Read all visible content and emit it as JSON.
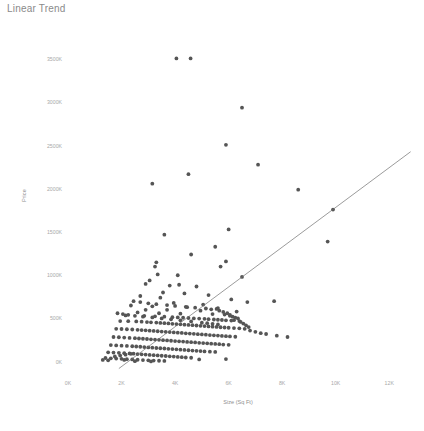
{
  "chart_data": {
    "type": "scatter",
    "title": "Linear Trend",
    "xlabel": "Size (Sq Ft)",
    "ylabel": "Price",
    "xlim": [
      0,
      13000
    ],
    "ylim": [
      -120000,
      3700000
    ],
    "grid": false,
    "legend": null,
    "xtick_labels": [
      "0K",
      "2K",
      "4K",
      "6K",
      "8K",
      "10K",
      "12K"
    ],
    "xtick_values": [
      0,
      2000,
      4000,
      6000,
      8000,
      10000,
      12000
    ],
    "ytick_labels": [
      "0K",
      "500K",
      "1000K",
      "1500K",
      "2000K",
      "2500K",
      "3000K",
      "3500K"
    ],
    "ytick_values": [
      0,
      500000,
      1000000,
      1500000,
      2000000,
      2500000,
      3000000,
      3500000
    ],
    "marker_color": "#555555",
    "marker_size": 1.9,
    "trendline": {
      "name": "Linear Trend",
      "color": "#707070",
      "width": 0.7,
      "x": [
        1900,
        12800
      ],
      "y": [
        -80000,
        2430000
      ]
    },
    "series": [
      {
        "name": "Houses",
        "points": [
          [
            4050,
            3510000
          ],
          [
            4580,
            3510000
          ],
          [
            6500,
            2940000
          ],
          [
            5900,
            2510000
          ],
          [
            7100,
            2280000
          ],
          [
            4500,
            2170000
          ],
          [
            3150,
            2060000
          ],
          [
            8600,
            1990000
          ],
          [
            9900,
            1760000
          ],
          [
            6000,
            1530000
          ],
          [
            3600,
            1470000
          ],
          [
            9700,
            1390000
          ],
          [
            5500,
            1330000
          ],
          [
            4600,
            1240000
          ],
          [
            5900,
            1160000
          ],
          [
            3300,
            1150000
          ],
          [
            3250,
            1100000
          ],
          [
            5700,
            1100000
          ],
          [
            3350,
            1010000
          ],
          [
            4100,
            1000000
          ],
          [
            6500,
            980000
          ],
          [
            3050,
            940000
          ],
          [
            2900,
            900000
          ],
          [
            4150,
            890000
          ],
          [
            3800,
            880000
          ],
          [
            4800,
            870000
          ],
          [
            3550,
            800000
          ],
          [
            4350,
            790000
          ],
          [
            5250,
            770000
          ],
          [
            2700,
            760000
          ],
          [
            3450,
            740000
          ],
          [
            6100,
            720000
          ],
          [
            7700,
            700000
          ],
          [
            6700,
            690000
          ],
          [
            3950,
            680000
          ],
          [
            5050,
            660000
          ],
          [
            2350,
            650000
          ],
          [
            3150,
            640000
          ],
          [
            4450,
            630000
          ],
          [
            5600,
            620000
          ],
          [
            2900,
            600000
          ],
          [
            3700,
            600000
          ],
          [
            4950,
            590000
          ],
          [
            6300,
            580000
          ],
          [
            2600,
            570000
          ],
          [
            3400,
            560000
          ],
          [
            4200,
            555000
          ],
          [
            5400,
            550000
          ],
          [
            5850,
            545000
          ],
          [
            6050,
            540000
          ],
          [
            2150,
            535000
          ],
          [
            2850,
            530000
          ],
          [
            3250,
            525000
          ],
          [
            3600,
            520000
          ],
          [
            3900,
            515000
          ],
          [
            4100,
            512000
          ],
          [
            4300,
            508000
          ],
          [
            4500,
            505000
          ],
          [
            4700,
            500000
          ],
          [
            4900,
            498000
          ],
          [
            5100,
            495000
          ],
          [
            5250,
            492000
          ],
          [
            5450,
            488000
          ],
          [
            5600,
            485000
          ],
          [
            5750,
            482000
          ],
          [
            5900,
            478000
          ],
          [
            6100,
            475000
          ],
          [
            1950,
            470000
          ],
          [
            2250,
            468000
          ],
          [
            2550,
            465000
          ],
          [
            2750,
            462000
          ],
          [
            2950,
            458000
          ],
          [
            3100,
            455000
          ],
          [
            3300,
            452000
          ],
          [
            3450,
            448000
          ],
          [
            3600,
            445000
          ],
          [
            3750,
            442000
          ],
          [
            3900,
            438000
          ],
          [
            4050,
            435000
          ],
          [
            4200,
            432000
          ],
          [
            4350,
            428000
          ],
          [
            4500,
            425000
          ],
          [
            4650,
            422000
          ],
          [
            4800,
            418000
          ],
          [
            4950,
            415000
          ],
          [
            5100,
            412000
          ],
          [
            5250,
            408000
          ],
          [
            5400,
            405000
          ],
          [
            5550,
            402000
          ],
          [
            5700,
            398000
          ],
          [
            5850,
            395000
          ],
          [
            6000,
            392000
          ],
          [
            6200,
            388000
          ],
          [
            6400,
            385000
          ],
          [
            1800,
            380000
          ],
          [
            2000,
            378000
          ],
          [
            2200,
            375000
          ],
          [
            2400,
            372000
          ],
          [
            2600,
            368000
          ],
          [
            2750,
            365000
          ],
          [
            2900,
            362000
          ],
          [
            3050,
            358000
          ],
          [
            3200,
            355000
          ],
          [
            3350,
            352000
          ],
          [
            3500,
            348000
          ],
          [
            3650,
            345000
          ],
          [
            3800,
            342000
          ],
          [
            3950,
            338000
          ],
          [
            4100,
            335000
          ],
          [
            4250,
            332000
          ],
          [
            4400,
            328000
          ],
          [
            4550,
            325000
          ],
          [
            4700,
            322000
          ],
          [
            4850,
            318000
          ],
          [
            5000,
            315000
          ],
          [
            5150,
            312000
          ],
          [
            5300,
            308000
          ],
          [
            5450,
            305000
          ],
          [
            5600,
            302000
          ],
          [
            5750,
            298000
          ],
          [
            5900,
            295000
          ],
          [
            6050,
            292000
          ],
          [
            6250,
            288000
          ],
          [
            1700,
            285000
          ],
          [
            1900,
            282000
          ],
          [
            2100,
            278000
          ],
          [
            2300,
            275000
          ],
          [
            2500,
            272000
          ],
          [
            2650,
            268000
          ],
          [
            2800,
            265000
          ],
          [
            2950,
            262000
          ],
          [
            3100,
            258000
          ],
          [
            3250,
            255000
          ],
          [
            3400,
            252000
          ],
          [
            3550,
            248000
          ],
          [
            3700,
            245000
          ],
          [
            3850,
            242000
          ],
          [
            4000,
            238000
          ],
          [
            4150,
            235000
          ],
          [
            4300,
            232000
          ],
          [
            4450,
            228000
          ],
          [
            4600,
            225000
          ],
          [
            4750,
            222000
          ],
          [
            4900,
            218000
          ],
          [
            5050,
            215000
          ],
          [
            5200,
            212000
          ],
          [
            5350,
            208000
          ],
          [
            5500,
            205000
          ],
          [
            5650,
            202000
          ],
          [
            5800,
            198000
          ],
          [
            6000,
            195000
          ],
          [
            1600,
            192000
          ],
          [
            1800,
            188000
          ],
          [
            2000,
            185000
          ],
          [
            2200,
            182000
          ],
          [
            2400,
            178000
          ],
          [
            2550,
            175000
          ],
          [
            2700,
            172000
          ],
          [
            2850,
            168000
          ],
          [
            3000,
            165000
          ],
          [
            3150,
            162000
          ],
          [
            3300,
            158000
          ],
          [
            3450,
            155000
          ],
          [
            3600,
            152000
          ],
          [
            3750,
            148000
          ],
          [
            3900,
            145000
          ],
          [
            4050,
            142000
          ],
          [
            4200,
            138000
          ],
          [
            4350,
            135000
          ],
          [
            4500,
            132000
          ],
          [
            4650,
            128000
          ],
          [
            4800,
            125000
          ],
          [
            4950,
            122000
          ],
          [
            5100,
            118000
          ],
          [
            5300,
            115000
          ],
          [
            5500,
            112000
          ],
          [
            1500,
            108000
          ],
          [
            1700,
            105000
          ],
          [
            1900,
            102000
          ],
          [
            2100,
            98000
          ],
          [
            2300,
            95000
          ],
          [
            2450,
            92000
          ],
          [
            2600,
            88000
          ],
          [
            2750,
            85000
          ],
          [
            2900,
            82000
          ],
          [
            3050,
            78000
          ],
          [
            3200,
            75000
          ],
          [
            3350,
            72000
          ],
          [
            3500,
            68000
          ],
          [
            3650,
            65000
          ],
          [
            3800,
            62000
          ],
          [
            3950,
            58000
          ],
          [
            4100,
            55000
          ],
          [
            4250,
            52000
          ],
          [
            4400,
            48000
          ],
          [
            4600,
            45000
          ],
          [
            1400,
            42000
          ],
          [
            1600,
            38000
          ],
          [
            1800,
            35000
          ],
          [
            2000,
            32000
          ],
          [
            2200,
            28000
          ],
          [
            2400,
            25000
          ],
          [
            2600,
            22000
          ],
          [
            2800,
            18000
          ],
          [
            3000,
            15000
          ],
          [
            3200,
            12000
          ],
          [
            3400,
            10000
          ],
          [
            3600,
            8000
          ],
          [
            1300,
            20000
          ],
          [
            1500,
            15000
          ],
          [
            5900,
            30000
          ],
          [
            4900,
            25000
          ],
          [
            2500,
            5000
          ],
          [
            3100,
            2000
          ],
          [
            6200,
            480000
          ],
          [
            6400,
            470000
          ],
          [
            6550,
            440000
          ],
          [
            6650,
            420000
          ],
          [
            6750,
            400000
          ],
          [
            6250,
            510000
          ],
          [
            6350,
            500000
          ],
          [
            6450,
            460000
          ],
          [
            6150,
            520000
          ],
          [
            6050,
            530000
          ],
          [
            5950,
            560000
          ],
          [
            5800,
            575000
          ],
          [
            6600,
            380000
          ],
          [
            6800,
            360000
          ],
          [
            7000,
            345000
          ],
          [
            7200,
            330000
          ],
          [
            5650,
            590000
          ],
          [
            5550,
            610000
          ],
          [
            5350,
            605000
          ],
          [
            5150,
            615000
          ],
          [
            4750,
            625000
          ],
          [
            4400,
            635000
          ],
          [
            4000,
            645000
          ],
          [
            3700,
            655000
          ],
          [
            3300,
            665000
          ],
          [
            3000,
            675000
          ],
          [
            2700,
            690000
          ],
          [
            2450,
            700000
          ],
          [
            5000,
            450000
          ],
          [
            5200,
            445000
          ],
          [
            5400,
            438000
          ],
          [
            5600,
            430000
          ],
          [
            4600,
            465000
          ],
          [
            4200,
            478000
          ],
          [
            3850,
            490000
          ],
          [
            3500,
            500000
          ],
          [
            3150,
            512000
          ],
          [
            2800,
            520000
          ],
          [
            2500,
            530000
          ],
          [
            2250,
            542000
          ],
          [
            2050,
            550000
          ],
          [
            1850,
            560000
          ],
          [
            7400,
            320000
          ],
          [
            7800,
            300000
          ],
          [
            8200,
            285000
          ],
          [
            2100,
            20000
          ],
          [
            1750,
            60000
          ],
          [
            1950,
            70000
          ],
          [
            2150,
            80000
          ],
          [
            2350,
            90000
          ]
        ]
      }
    ]
  },
  "caption": {
    "text": ""
  }
}
